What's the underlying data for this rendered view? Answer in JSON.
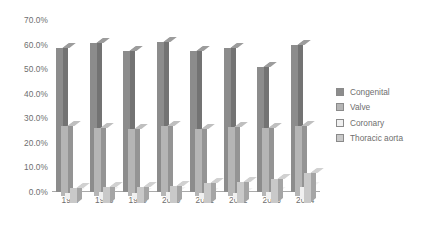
{
  "chart_data": {
    "type": "bar",
    "title": "",
    "subtitle": "",
    "xlabel": "",
    "ylabel": "",
    "ylim": [
      0,
      70
    ],
    "ytick_labels": [
      "0.0%",
      "10.0%",
      "20.0%",
      "30.0%",
      "40.0%",
      "50.0%",
      "60.0%",
      "70.0%"
    ],
    "ytick_values": [
      0,
      10,
      20,
      30,
      40,
      50,
      60,
      70
    ],
    "grid": false,
    "three_d": true,
    "legend_position": "right",
    "categories": [
      "1997",
      "1998",
      "1999",
      "2000",
      "2001",
      "2002",
      "2003",
      "2004"
    ],
    "series": [
      {
        "name": "Congenital",
        "color": "#8c8c8c",
        "values": [
          58.5,
          60.5,
          57.5,
          61.0,
          57.5,
          58.5,
          51.0,
          60.0
        ]
      },
      {
        "name": "Valve",
        "color": "#b5b5b5",
        "values": [
          28.5,
          27.5,
          27.0,
          28.5,
          27.0,
          28.0,
          27.5,
          28.5
        ]
      },
      {
        "name": "Coronary",
        "color": "#f0f0f0",
        "values": [
          2.5,
          3.0,
          2.5,
          3.0,
          2.5,
          2.5,
          3.0,
          5.0
        ]
      },
      {
        "name": "Thoracic aorta",
        "color": "#c9c9c9",
        "values": [
          6.0,
          6.5,
          6.5,
          7.0,
          8.0,
          8.5,
          9.5,
          12.0
        ]
      }
    ]
  },
  "legend": {
    "items": [
      {
        "label": "Congenital"
      },
      {
        "label": "Valve"
      },
      {
        "label": "Coronary"
      },
      {
        "label": "Thoracic aorta"
      }
    ]
  }
}
